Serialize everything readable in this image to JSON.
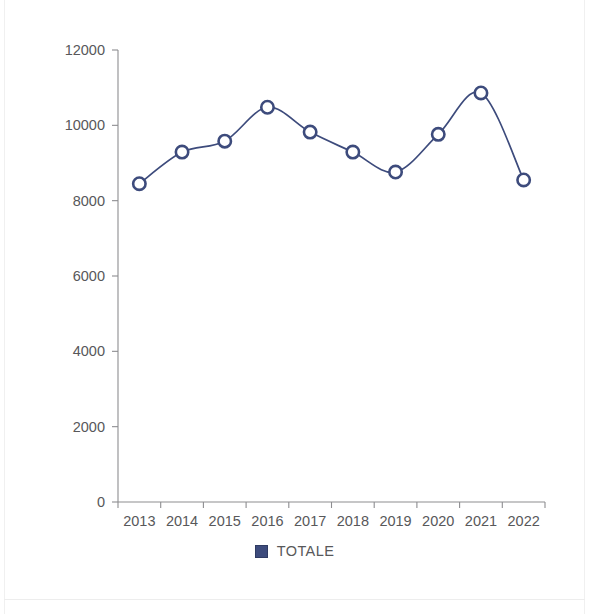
{
  "chart_data": {
    "type": "line",
    "title": "",
    "subtitle": "",
    "xlabel": "",
    "ylabel": "",
    "categories": [
      "2013",
      "2014",
      "2015",
      "2016",
      "2017",
      "2018",
      "2019",
      "2020",
      "2021",
      "2022"
    ],
    "series": [
      {
        "name": "TOTALE",
        "color": "#3d4b7c",
        "marker": "open-circle",
        "values": [
          8450,
          9290,
          9580,
          10480,
          9820,
          9290,
          8760,
          9760,
          10860,
          8550
        ]
      }
    ],
    "xtick_labels": [
      "2013",
      "2014",
      "2015",
      "2016",
      "2017",
      "2018",
      "2019",
      "2020",
      "2021",
      "2022"
    ],
    "ytick_labels": [
      "0",
      "2000",
      "4000",
      "6000",
      "8000",
      "10000",
      "12000"
    ],
    "yticks": [
      0,
      2000,
      4000,
      6000,
      8000,
      10000,
      12000
    ],
    "ylim": [
      0,
      12000
    ],
    "grid": false,
    "legend": {
      "position": "bottom-center",
      "entries": [
        {
          "label": "TOTALE",
          "color": "#3d4b7c",
          "swatch": "filled-square"
        }
      ]
    },
    "axis_color": "#8d8d90",
    "tick_text_color": "#58585a",
    "background_color": "#ffffff"
  }
}
